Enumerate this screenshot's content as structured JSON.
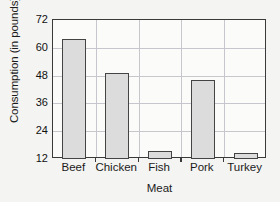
{
  "chart_data": {
    "type": "bar",
    "title": "",
    "xlabel": "Meat",
    "ylabel": "Consumption (in pounds)",
    "categories": [
      "Beef",
      "Chicken",
      "Fish",
      "Pork",
      "Turkey"
    ],
    "values": [
      64,
      49,
      15.5,
      46,
      14.5
    ],
    "ylim": [
      12,
      72
    ],
    "yticks": [
      12,
      24,
      36,
      48,
      60,
      72
    ],
    "ytick_labels": [
      "12",
      "24",
      "36",
      "48",
      "60",
      "72"
    ],
    "grid": true,
    "legend": null,
    "colors": {
      "bar_fill": "#dcdcdc",
      "bar_border": "#444444",
      "gridline": "#c6c6cc",
      "axis": "#3a3a3a",
      "background": "#f4f4f2",
      "plot_background": "#fbfbfa",
      "text": "#1b1b1b"
    }
  }
}
